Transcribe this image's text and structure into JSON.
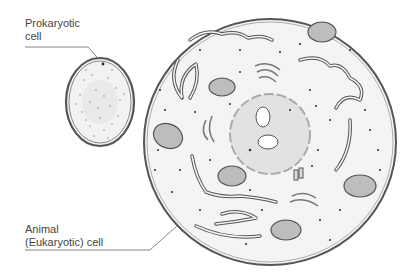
{
  "labels": {
    "prokaryotic_line1": "Prokaryotic",
    "prokaryotic_line2": "cell",
    "animal_line1": "Animal",
    "animal_line2": "(Eukaryotic) cell"
  },
  "colors": {
    "outline": "#555555",
    "cytoplasm": "#f4f4f4",
    "organelle_fill": "#bdbdbd",
    "nucleus_fill": "#e2e2e2",
    "dots": "#2a2a2a",
    "leader_line": "#666666"
  }
}
